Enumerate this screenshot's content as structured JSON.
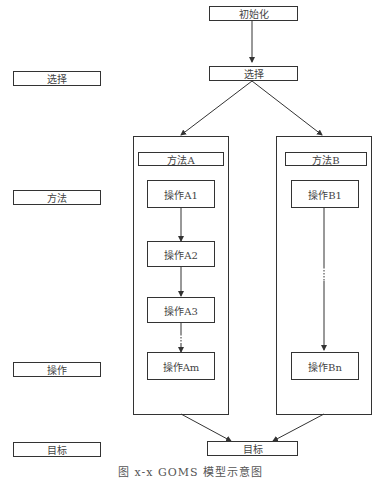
{
  "left_labels": {
    "goal_select": "选择",
    "method": "方法",
    "operation": "操作",
    "target": "目标"
  },
  "flow": {
    "init": "初始化",
    "select": "选择",
    "target": "目标"
  },
  "method_a": {
    "title": "方法A",
    "ops": [
      "操作A1",
      "操作A2",
      "操作A3",
      "操作Am"
    ],
    "ellipsis": "⋮"
  },
  "method_b": {
    "title": "方法B",
    "ops": [
      "操作B1",
      "操作Bn"
    ],
    "ellipsis": "⋮"
  },
  "caption": "图 x-x  GOMS 模型示意图"
}
